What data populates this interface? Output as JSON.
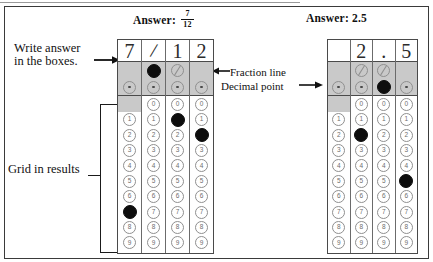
{
  "headers": {
    "left_answer_prefix": "Answer:",
    "left_answer_numerator": "7",
    "left_answer_denominator": "12",
    "right_answer": "Answer: 2.5"
  },
  "annotations": {
    "write_answer": "Write answer",
    "write_answer_line2": "in the boxes.",
    "fraction_line": "Fraction line",
    "decimal_point": "Decimal point",
    "grid_in_results": "Grid in results"
  },
  "grids": [
    {
      "name": "fraction-grid",
      "handwritten": [
        "7",
        "/",
        "1",
        "2"
      ],
      "columns": [
        {
          "handwritten": "7",
          "slash_bubble": "none",
          "slash_filled": false,
          "dot_filled": false,
          "has_zero": false,
          "digits": [
            "0",
            "1",
            "2",
            "3",
            "4",
            "5",
            "6",
            "7",
            "8",
            "9"
          ],
          "filled_digit": "7"
        },
        {
          "handwritten": "/",
          "slash_bubble": "slash",
          "slash_filled": true,
          "dot_filled": false,
          "has_zero": true,
          "digits": [
            "0",
            "1",
            "2",
            "3",
            "4",
            "5",
            "6",
            "7",
            "8",
            "9"
          ],
          "filled_digit": null
        },
        {
          "handwritten": "1",
          "slash_bubble": "slash",
          "slash_filled": false,
          "dot_filled": false,
          "has_zero": true,
          "digits": [
            "0",
            "1",
            "2",
            "3",
            "4",
            "5",
            "6",
            "7",
            "8",
            "9"
          ],
          "filled_digit": "1"
        },
        {
          "handwritten": "2",
          "slash_bubble": "none",
          "slash_filled": false,
          "dot_filled": false,
          "has_zero": true,
          "digits": [
            "0",
            "1",
            "2",
            "3",
            "4",
            "5",
            "6",
            "7",
            "8",
            "9"
          ],
          "filled_digit": "2"
        }
      ]
    },
    {
      "name": "decimal-grid",
      "handwritten": [
        "",
        "2",
        ".",
        "5"
      ],
      "columns": [
        {
          "handwritten": "",
          "slash_bubble": "none",
          "slash_filled": false,
          "dot_filled": false,
          "has_zero": false,
          "digits": [
            "0",
            "1",
            "2",
            "3",
            "4",
            "5",
            "6",
            "7",
            "8",
            "9"
          ],
          "filled_digit": null
        },
        {
          "handwritten": "2",
          "slash_bubble": "slash",
          "slash_filled": false,
          "dot_filled": false,
          "has_zero": true,
          "digits": [
            "0",
            "1",
            "2",
            "3",
            "4",
            "5",
            "6",
            "7",
            "8",
            "9"
          ],
          "filled_digit": "2"
        },
        {
          "handwritten": ".",
          "slash_bubble": "slash",
          "slash_filled": false,
          "dot_filled": true,
          "has_zero": true,
          "digits": [
            "0",
            "1",
            "2",
            "3",
            "4",
            "5",
            "6",
            "7",
            "8",
            "9"
          ],
          "filled_digit": null
        },
        {
          "handwritten": "5",
          "slash_bubble": "none",
          "slash_filled": false,
          "dot_filled": false,
          "has_zero": true,
          "digits": [
            "0",
            "1",
            "2",
            "3",
            "4",
            "5",
            "6",
            "7",
            "8",
            "9"
          ],
          "filled_digit": "5"
        }
      ]
    }
  ],
  "colors": {
    "shade": "#c9c9c9",
    "bubble_outline": "#8f8f8f",
    "filled_bubble": "#0d0d0d",
    "border": "#4a4a4a"
  }
}
